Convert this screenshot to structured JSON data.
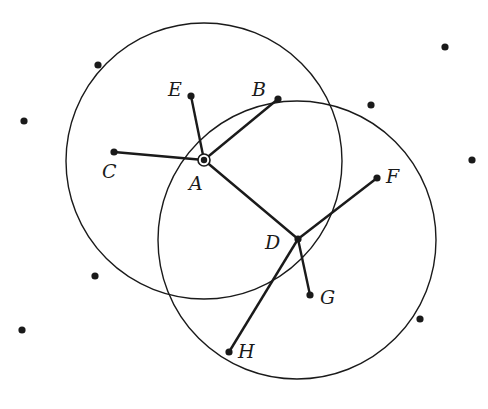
{
  "diagram": {
    "type": "neighborhood-graph",
    "colors": {
      "stroke": "#1a1a1a",
      "background": "#ffffff"
    },
    "circles": [
      {
        "id": "circle-A",
        "cx": 204,
        "cy": 161,
        "r": 138
      },
      {
        "id": "circle-D",
        "cx": 297,
        "cy": 240,
        "r": 139
      }
    ],
    "labeled_points": [
      {
        "label": "A",
        "x": 204,
        "y": 160,
        "lx": 189,
        "ly": 174,
        "special": true
      },
      {
        "label": "B",
        "x": 278,
        "y": 99,
        "lx": 252,
        "ly": 80
      },
      {
        "label": "C",
        "x": 114,
        "y": 152,
        "lx": 102,
        "ly": 162
      },
      {
        "label": "D",
        "x": 298,
        "y": 239,
        "lx": 265,
        "ly": 233
      },
      {
        "label": "E",
        "x": 191,
        "y": 96,
        "lx": 168,
        "ly": 80
      },
      {
        "label": "F",
        "x": 377,
        "y": 178,
        "lx": 386,
        "ly": 167
      },
      {
        "label": "G",
        "x": 310,
        "y": 295,
        "lx": 320,
        "ly": 288
      },
      {
        "label": "H",
        "x": 229,
        "y": 352,
        "lx": 238,
        "ly": 342
      }
    ],
    "edges": [
      [
        "A",
        "B"
      ],
      [
        "A",
        "C"
      ],
      [
        "A",
        "E"
      ],
      [
        "A",
        "D"
      ],
      [
        "D",
        "F"
      ],
      [
        "D",
        "G"
      ],
      [
        "D",
        "H"
      ]
    ],
    "unlabeled_points": [
      {
        "x": 98,
        "y": 65
      },
      {
        "x": 24,
        "y": 121
      },
      {
        "x": 371,
        "y": 105
      },
      {
        "x": 445,
        "y": 47
      },
      {
        "x": 472,
        "y": 160
      },
      {
        "x": 95,
        "y": 276
      },
      {
        "x": 22,
        "y": 330
      },
      {
        "x": 420,
        "y": 319
      }
    ]
  }
}
